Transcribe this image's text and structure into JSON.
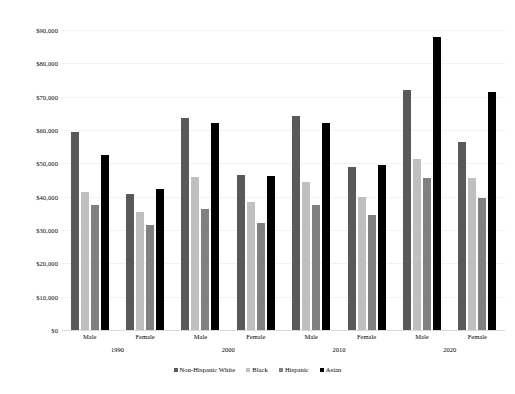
{
  "chart_data": {
    "type": "bar",
    "title": "",
    "subtitle": "",
    "xlabel": "",
    "ylabel": "",
    "ylim": [
      0,
      90000
    ],
    "ytick_labels": [
      "$0",
      "$10,000",
      "$20,000",
      "$30,000",
      "$40,000",
      "$50,000",
      "$60,000",
      "$70,000",
      "$80,000",
      "$90,000"
    ],
    "ytick_values": [
      0,
      10000,
      20000,
      30000,
      40000,
      50000,
      60000,
      70000,
      80000,
      90000
    ],
    "grid": true,
    "legend_position": "bottom",
    "categories": [
      "Male",
      "Female",
      "Male",
      "Female",
      "Male",
      "Female",
      "Male",
      "Female"
    ],
    "group_labels": [
      "1990",
      "2000",
      "2010",
      "2020"
    ],
    "series": [
      {
        "name": "Non-Hispanic White",
        "color": "#595959",
        "values": [
          59500,
          40800,
          63500,
          46500,
          64300,
          49000,
          72000,
          56500
        ]
      },
      {
        "name": "Black",
        "color": "#bfbfbf",
        "values": [
          41500,
          35500,
          45800,
          38400,
          44500,
          40000,
          51300,
          45500
        ]
      },
      {
        "name": "Hispanic",
        "color": "#808080",
        "values": [
          37500,
          31500,
          36300,
          32200,
          37500,
          34500,
          45500,
          39700
        ]
      },
      {
        "name": "Asian",
        "color": "#000000",
        "values": [
          52500,
          42300,
          62000,
          46300,
          62000,
          49500,
          88000,
          71300
        ]
      }
    ]
  }
}
